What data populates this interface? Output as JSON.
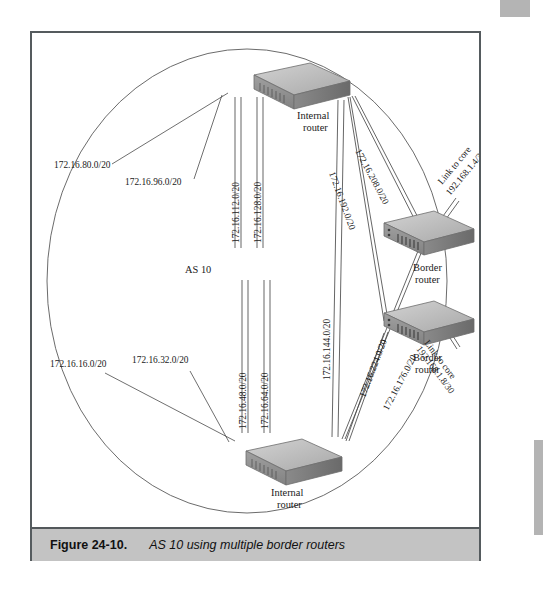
{
  "figure": {
    "caption_label": "Figure 24-10.",
    "caption_text": "AS 10 using multiple border routers",
    "as_label": "AS 10"
  },
  "page_artifacts": {
    "header_text": ""
  },
  "devices": [
    {
      "id": "internal-router-top",
      "line1": "Internal",
      "line2": "router"
    },
    {
      "id": "internal-router-bottom",
      "line1": "Internal",
      "line2": "router"
    },
    {
      "id": "border-router-upper",
      "line1": "Border",
      "line2": "router"
    },
    {
      "id": "border-router-lower",
      "line1": "Border",
      "line2": "router"
    }
  ],
  "subnets": {
    "top_left_outer": "172.16.80.0/20",
    "top_left_inner": "172.16.96.0/20",
    "top_vert_left": "172.16.112.0/20",
    "top_vert_right": "172.16.128.0/20",
    "backbone": "172.16.144.0/20",
    "to_border_upper_a": "172.16.192.0/20",
    "to_border_upper_b": "172.16.208.0/20",
    "to_border_lower_a": "172.16.176.0/20",
    "to_border_lower_b": "172.16.224.0/20",
    "bottom_left_outer": "172.16.16.0/20",
    "bottom_left_inner": "172.16.32.0/20",
    "bottom_vert_left": "172.16.48.0/20",
    "bottom_vert_right": "172.16.64.0/20"
  },
  "core_links": [
    {
      "id": "core-link-upper",
      "line1": "Link to core",
      "line2": "192.168.1.4/30"
    },
    {
      "id": "core-link-lower",
      "line1": "Link to core",
      "line2": "192.168.1.8/30"
    }
  ],
  "colors": {
    "frame": "#555b5e",
    "caption_bg": "#c3c3c3",
    "line": "#4a4a4a",
    "device_top": "#b9b9b9",
    "device_front": "#8f8f8f",
    "device_side": "#6f6f6f"
  }
}
